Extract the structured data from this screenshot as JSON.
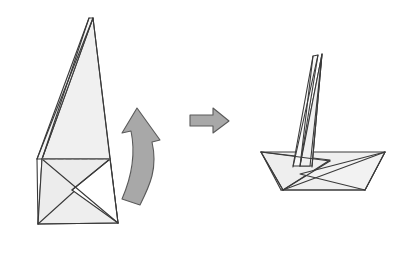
{
  "figure": {
    "background_color": "#ffffff"
  },
  "style": {
    "paper_fill": "#f0f0f0",
    "paper_fill_light": "#f6f6f6",
    "paper_fill_shade": "#e8e8e8",
    "paper_stroke": "#3a3a3a",
    "fold_dashed_stroke": "#6e6e6e",
    "arrow_fill": "#a8a8a8",
    "arrow_stroke": "#5a5a5a",
    "stroke_width": "1.1",
    "dash_pattern": "5,3"
  },
  "panels": [
    {
      "id": "before",
      "name": "Folded triangular form (before)",
      "label": "",
      "shapes": [
        {
          "name": "main-triangle-body",
          "points": "93,18 110,159 42,159",
          "fill": "#f0f0f0"
        },
        {
          "name": "left-flap-strip",
          "points": "93,18 42,159 37,159 89,18",
          "fill": "#f6f6f6"
        },
        {
          "name": "lower-left-wing",
          "points": "42,159 110,159 38,224",
          "fill": "#ececec"
        },
        {
          "name": "lower-right-wing",
          "points": "110,159 118,223 72,190",
          "fill": "#f0f0f0"
        },
        {
          "name": "lower-center-panel",
          "points": "42,159 110,159 118,223 38,224",
          "fill": "#eeeeee"
        }
      ],
      "fold_lines": [
        {
          "name": "horizontal-valley-fold",
          "points": "42,159 110,159",
          "dashed": true
        }
      ],
      "edges": [
        {
          "name": "apex-to-left-edge",
          "points": "93,18 37,159"
        },
        {
          "name": "apex-to-inner-left-edge",
          "points": "89,18 42,159"
        },
        {
          "name": "apex-to-right-edge",
          "points": "93,18 118,223"
        },
        {
          "name": "left-lower-edge",
          "points": "37,159 38,224"
        },
        {
          "name": "left-bottom-to-crossing",
          "points": "38,224 118,223"
        },
        {
          "name": "crossing-diagonal",
          "points": "42,159 118,223"
        },
        {
          "name": "right-inner-diagonal",
          "points": "110,159 72,190"
        }
      ]
    },
    {
      "id": "after",
      "name": "Completed paper boat (after)",
      "label": "",
      "shapes": [
        {
          "name": "sail-main",
          "points": "322,54 310,166 300,166",
          "fill": "#f0f0f0"
        },
        {
          "name": "sail-left-strip",
          "points": "318,55 300,166 293,166 313,56",
          "fill": "#f6f6f6"
        },
        {
          "name": "sail-right-body",
          "points": "322,54 312,166 300,166",
          "fill": "#eeeeee"
        },
        {
          "name": "hull-left-wing",
          "points": "261,152 330,160 283,190",
          "fill": "#eeeeee"
        },
        {
          "name": "hull-right-wing",
          "points": "385,152 365,190 300,174",
          "fill": "#f0f0f0"
        },
        {
          "name": "hull-body",
          "points": "261,152 385,152 365,190 281,190",
          "fill": "#efefef"
        }
      ],
      "fold_lines": [],
      "edges": [
        {
          "name": "sail-apex-left-edge",
          "points": "318,55 293,167"
        },
        {
          "name": "sail-apex-inner-left-edge",
          "points": "313,56 300,166"
        },
        {
          "name": "sail-apex-right-edge",
          "points": "322,54 312,167"
        },
        {
          "name": "hull-left-tip-to-top",
          "points": "261,152 330,161"
        },
        {
          "name": "hull-left-tip-to-bottom",
          "points": "261,152 283,190"
        },
        {
          "name": "hull-bottom-edge",
          "points": "281,190 365,190"
        },
        {
          "name": "hull-right-tip-to-bottom",
          "points": "385,152 365,190"
        },
        {
          "name": "hull-right-diagonal",
          "points": "385,152 283,190"
        },
        {
          "name": "hull-mid-diagonal",
          "points": "330,161 283,190"
        }
      ]
    }
  ],
  "arrows": [
    {
      "name": "curved-fold-arrow",
      "type": "curved",
      "direction": "up-left",
      "path": "M 140,205 C 150,185 158,168 152,142 L 160,140 L 137,108 L 122,133 L 131,131 C 136,155 132,176 122,199 Z",
      "fill": "#a8a8a8",
      "stroke": "#5a5a5a"
    },
    {
      "name": "transition-arrow",
      "type": "straight",
      "direction": "right",
      "path": "M 190,115 L 213,115 L 213,108 L 229,121 L 213,133 L 213,126 L 190,126 Z",
      "fill": "#a8a8a8",
      "stroke": "#5a5a5a"
    }
  ]
}
